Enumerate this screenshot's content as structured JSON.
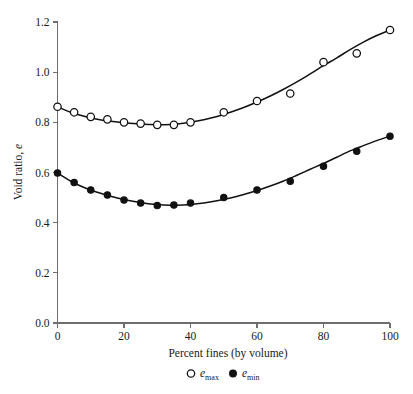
{
  "chart_data": {
    "type": "scatter",
    "title": "",
    "xlabel": "Percent fines (by volume)",
    "ylabel": "Void ratio, e",
    "xlim": [
      0,
      100
    ],
    "ylim": [
      0.0,
      1.2
    ],
    "xticks": [
      "0",
      "20",
      "40",
      "60",
      "80",
      "100"
    ],
    "xtick_values": [
      0,
      20,
      40,
      60,
      80,
      100
    ],
    "yticks": [
      "0.0",
      "0.2",
      "0.4",
      "0.6",
      "0.8",
      "1.0",
      "1.2"
    ],
    "ytick_values": [
      0.0,
      0.2,
      0.4,
      0.6,
      0.8,
      1.0,
      1.2
    ],
    "grid": false,
    "legend_position": "below-axis",
    "series": [
      {
        "name": "e_max",
        "legend_label": "e",
        "legend_subscript": "max",
        "marker": "open-circle",
        "color": "#111111",
        "x": [
          0,
          5,
          10,
          15,
          20,
          25,
          30,
          35,
          40,
          50,
          60,
          70,
          80,
          90,
          100
        ],
        "y": [
          0.862,
          0.84,
          0.822,
          0.812,
          0.8,
          0.795,
          0.79,
          0.79,
          0.8,
          0.84,
          0.885,
          0.915,
          1.04,
          1.075,
          1.168
        ]
      },
      {
        "name": "e_min",
        "legend_label": "e",
        "legend_subscript": "min",
        "marker": "filled-circle",
        "color": "#111111",
        "x": [
          0,
          5,
          10,
          15,
          20,
          25,
          30,
          35,
          40,
          50,
          60,
          70,
          80,
          90,
          100
        ],
        "y": [
          0.598,
          0.56,
          0.53,
          0.51,
          0.49,
          0.478,
          0.468,
          0.47,
          0.478,
          0.5,
          0.53,
          0.565,
          0.625,
          0.685,
          0.745
        ]
      }
    ],
    "fit_curves": [
      {
        "name": "e_max_fit",
        "x": [
          0,
          4,
          8,
          12,
          16,
          20,
          24,
          28,
          32,
          36,
          40,
          44,
          48,
          52,
          56,
          60,
          64,
          68,
          72,
          76,
          80,
          84,
          88,
          92,
          96,
          100
        ],
        "y": [
          0.862,
          0.84,
          0.824,
          0.812,
          0.804,
          0.798,
          0.794,
          0.791,
          0.79,
          0.793,
          0.8,
          0.81,
          0.823,
          0.84,
          0.859,
          0.881,
          0.905,
          0.932,
          0.961,
          0.993,
          1.026,
          1.057,
          1.09,
          1.12,
          1.146,
          1.168
        ]
      },
      {
        "name": "e_min_fit",
        "x": [
          0,
          4,
          8,
          12,
          16,
          20,
          24,
          28,
          32,
          36,
          40,
          44,
          48,
          52,
          56,
          60,
          64,
          68,
          72,
          76,
          80,
          84,
          88,
          92,
          96,
          100
        ],
        "y": [
          0.598,
          0.565,
          0.54,
          0.521,
          0.505,
          0.492,
          0.482,
          0.474,
          0.47,
          0.469,
          0.472,
          0.478,
          0.487,
          0.498,
          0.512,
          0.528,
          0.546,
          0.566,
          0.589,
          0.613,
          0.636,
          0.661,
          0.686,
          0.707,
          0.727,
          0.745
        ]
      }
    ]
  },
  "figure": {
    "caption": ""
  }
}
